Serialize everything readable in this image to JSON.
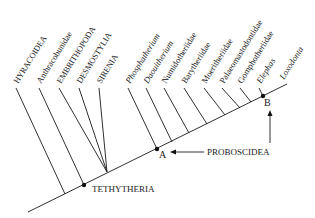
{
  "diagram": {
    "type": "cladogram",
    "taxa": [
      {
        "label": "HYRACOIDEA",
        "style": "caps"
      },
      {
        "label": "Anthracobunidae",
        "style": "normal"
      },
      {
        "label": "EMBRITHOPODA",
        "style": "caps"
      },
      {
        "label": "DESMOSTYLIA",
        "style": "caps"
      },
      {
        "label": "SIRENIA",
        "style": "caps"
      },
      {
        "label": "Phosphatherium",
        "style": "italic"
      },
      {
        "label": "Daouitherium",
        "style": "italic"
      },
      {
        "label": "Numidotheriidae",
        "style": "normal"
      },
      {
        "label": "Barytheriidae",
        "style": "normal"
      },
      {
        "label": "Moeritheriidae",
        "style": "normal"
      },
      {
        "label": "Palaeomastodontidae",
        "style": "normal"
      },
      {
        "label": "Gomphotheriidae",
        "style": "normal"
      },
      {
        "label": "Elephas",
        "style": "italic"
      },
      {
        "label": "Loxodonta",
        "style": "italic"
      }
    ],
    "nodes": {
      "tethytheria": "TETHYTHERIA",
      "a": "A",
      "b": "B"
    },
    "clade_label": "PROBOSCIDEA"
  }
}
